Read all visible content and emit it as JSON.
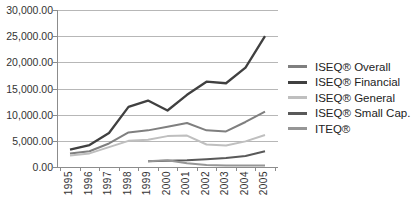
{
  "chart_data": {
    "type": "line",
    "title": "",
    "xlabel": "",
    "ylabel": "",
    "x": [
      "1995",
      "1996",
      "1997",
      "1998",
      "1999",
      "2000",
      "2001",
      "2002",
      "2003",
      "2004",
      "2005"
    ],
    "series": [
      {
        "name": "ISEQ® Overall",
        "color": "#7f7f7f",
        "width": 2,
        "values": [
          2600,
          3000,
          4500,
          6600,
          7000,
          7700,
          8400,
          7000,
          6800,
          8600,
          10600
        ]
      },
      {
        "name": "ISEQ® Financial",
        "color": "#404040",
        "width": 2.3,
        "values": [
          3300,
          4200,
          6500,
          11500,
          12700,
          10800,
          13800,
          16300,
          16000,
          19000,
          25000
        ]
      },
      {
        "name": "ISEQ® General",
        "color": "#bfbfbf",
        "width": 2,
        "values": [
          2200,
          2600,
          3800,
          5000,
          5200,
          5900,
          6000,
          4300,
          4100,
          4900,
          6100
        ]
      },
      {
        "name": "ISEQ® Small Cap.",
        "color": "#595959",
        "width": 2,
        "values": [
          null,
          null,
          null,
          null,
          1100,
          1200,
          1300,
          1500,
          1700,
          2100,
          3000
        ]
      },
      {
        "name": "ITEQ®",
        "color": "#969696",
        "width": 2,
        "values": [
          null,
          null,
          null,
          null,
          1100,
          1300,
          700,
          400,
          300,
          300,
          300
        ]
      }
    ],
    "ylim": [
      0,
      30000
    ],
    "ytick_step": 5000,
    "ytick_labels": [
      "0.00",
      "5,000.00",
      "10,000.00",
      "15,000.00",
      "20,000.00",
      "25,000.00",
      "30,000.00"
    ],
    "grid": true,
    "legend_position": "right",
    "colors": {
      "gridline": "#b7b7b7",
      "axis": "#8c8c8c",
      "axis_text": "#333333",
      "legend_text": "#222222",
      "background": "#ffffff"
    }
  }
}
